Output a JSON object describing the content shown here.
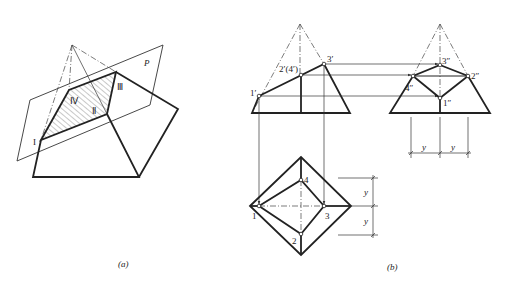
{
  "figure_a": {
    "caption": "(a)",
    "plane_label": "P",
    "vertex_labels": {
      "I": "I",
      "II": "Ⅱ",
      "III": "Ⅲ",
      "IV": "Ⅳ"
    }
  },
  "figure_b": {
    "caption": "(b)",
    "front_view": {
      "p1": "1′",
      "p24": "2′(4′)",
      "p3": "3′"
    },
    "side_view": {
      "p3": "3″",
      "p2": "2″",
      "p4": "4″",
      "p1": "1″",
      "dim_left": "y",
      "dim_right": "y"
    },
    "top_view": {
      "p1": "1",
      "p2": "2",
      "p3": "3",
      "p4": "4",
      "dim_top": "y",
      "dim_bottom": "y"
    }
  },
  "colors": {
    "line": "#222222",
    "background": "#ffffff"
  }
}
